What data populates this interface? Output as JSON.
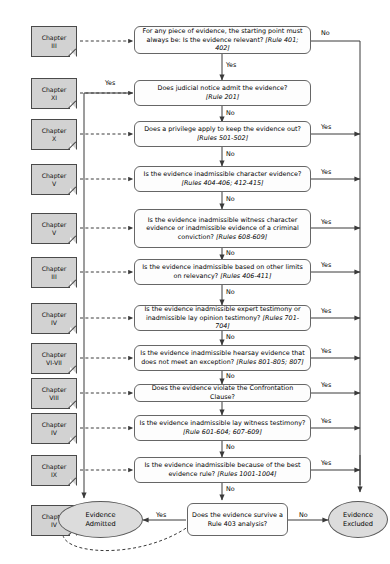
{
  "diagram": {
    "colors": {
      "chapter_fill": "#d2d2d2",
      "chapter_stroke": "#4a4a4a",
      "decision_fill": "#fdfdfd",
      "decision_stroke": "#666666",
      "terminal_fill": "#dcdcdc",
      "terminal_stroke": "#5a5a5a",
      "connector": "#3a3a3a",
      "background": "#ffffff"
    }
  },
  "chapters": [
    {
      "id": "ch-3-relevance",
      "line1": "Chapter",
      "line2": "III"
    },
    {
      "id": "ch-11-notice",
      "line1": "Chapter",
      "line2": "XI"
    },
    {
      "id": "ch-10-privilege",
      "line1": "Chapter",
      "line2": "X"
    },
    {
      "id": "ch-5-character",
      "line1": "Chapter",
      "line2": "V"
    },
    {
      "id": "ch-5-witness",
      "line1": "Chapter",
      "line2": "V"
    },
    {
      "id": "ch-3-limits",
      "line1": "Chapter",
      "line2": "III"
    },
    {
      "id": "ch-4-expert",
      "line1": "Chapter",
      "line2": "IV"
    },
    {
      "id": "ch-67-hearsay",
      "line1": "Chapter",
      "line2": "VI-VII"
    },
    {
      "id": "ch-8-confront",
      "line1": "Chapter",
      "line2": "VIII"
    },
    {
      "id": "ch-4-lay",
      "line1": "Chapter",
      "line2": "IV"
    },
    {
      "id": "ch-9-best",
      "line1": "Chapter",
      "line2": "IX"
    },
    {
      "id": "ch-4-rule403",
      "line1": "Chapter",
      "line2": "IV"
    }
  ],
  "decisions": [
    {
      "id": "relevance",
      "text": "For any piece of evidence, the starting point must always be: Is the evidence relevant? ",
      "rule": "[Rule 401; 402]",
      "out_yes": "Yes",
      "out_no": "No"
    },
    {
      "id": "judicial-notice",
      "text": "Does judicial notice admit the evidence? ",
      "rule": "[Rule 201]",
      "out_yes": "Yes",
      "out_no": "No"
    },
    {
      "id": "privilege",
      "text": "Does a privilege apply to keep the evidence out? ",
      "rule": "[Rules 501-502]",
      "out_yes": "Yes",
      "out_no": "No"
    },
    {
      "id": "character-evidence",
      "text": "Is the evidence inadmissible character evidence? ",
      "rule": "[Rules 404-406; 412-415]",
      "out_yes": "Yes",
      "out_no": "No"
    },
    {
      "id": "witness-character",
      "text": "Is the evidence inadmissible witness character evidence or inadmissible evidence of a criminal conviction? ",
      "rule": "[Rules 608-609]",
      "out_yes": "Yes",
      "out_no": "No"
    },
    {
      "id": "other-relevancy-limits",
      "text": "Is the evidence inadmissible based on other limits on relevancy? ",
      "rule": "[Rules 406-411]",
      "out_yes": "Yes",
      "out_no": "No"
    },
    {
      "id": "expert-opinion",
      "text": "Is the evidence inadmissible expert testimony or inadmissible lay opinion testimony? ",
      "rule": "[Rules 701-704]",
      "out_yes": "Yes",
      "out_no": "No"
    },
    {
      "id": "hearsay",
      "text": "Is the evidence inadmissible hearsay evidence that does not meet an exception? ",
      "rule": "[Rules 801-805; 807]",
      "out_yes": "Yes",
      "out_no": "No"
    },
    {
      "id": "confrontation-clause",
      "text": "Does the evidence violate the Confrontation Clause?",
      "rule": "",
      "out_yes": "Yes",
      "out_no": ""
    },
    {
      "id": "lay-witness",
      "text": "Is the evidence inadmissible lay witness testimony? ",
      "rule": "[Rule 601-604; 607-609]",
      "out_yes": "Yes",
      "out_no": "No"
    },
    {
      "id": "best-evidence",
      "text": "Is the evidence inadmissible because of the best evidence rule? ",
      "rule": "[Rules 1001-1004]",
      "out_yes": "Yes",
      "out_no": "No"
    },
    {
      "id": "rule-403",
      "text": "Does the evidence survive a Rule 403 analysis?",
      "rule": "",
      "out_yes": "Yes",
      "out_no": "No"
    }
  ],
  "terminals": [
    {
      "id": "evidence-admitted",
      "line1": "Evidence",
      "line2": "Admitted"
    },
    {
      "id": "evidence-excluded",
      "line1": "Evidence",
      "line2": "Excluded"
    }
  ],
  "edge_labels": {
    "no": "No",
    "yes": "Yes"
  }
}
